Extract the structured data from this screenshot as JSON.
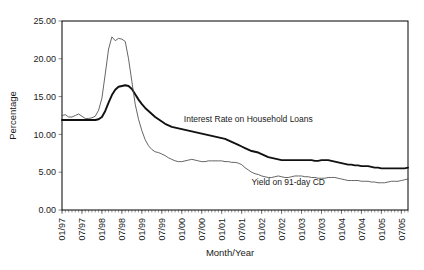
{
  "chart_data": {
    "type": "line",
    "title": "",
    "xlabel": "Month/Year",
    "ylabel": "Percentage",
    "ylim": [
      0,
      25
    ],
    "ytick_labels": [
      "0.00",
      "5.00",
      "10.00",
      "15.00",
      "20.00",
      "25.00"
    ],
    "ytick_values": [
      0,
      5,
      10,
      15,
      20,
      25
    ],
    "grid": false,
    "legend_position": "inline-annotation",
    "x_major_labels": [
      "01/97",
      "07/97",
      "01/98",
      "07/98",
      "01/99",
      "07/99",
      "01/00",
      "07/00",
      "01/01",
      "07/01",
      "01/02",
      "07/02",
      "01/03",
      "07/03",
      "01/04",
      "07/04",
      "01/05",
      "07/05"
    ],
    "x_major_indices": [
      0,
      6,
      12,
      18,
      24,
      30,
      36,
      42,
      48,
      54,
      60,
      66,
      72,
      78,
      84,
      90,
      96,
      102
    ],
    "x_count": 105,
    "series": [
      {
        "name": "Interest Rate on Household Loans",
        "style": "thick",
        "label_x_index": 56,
        "label_y_value": 11.6,
        "values": [
          11.9,
          11.9,
          11.9,
          11.9,
          11.9,
          11.9,
          11.9,
          11.9,
          11.9,
          11.9,
          11.9,
          12.0,
          12.3,
          13.1,
          14.2,
          15.2,
          15.9,
          16.3,
          16.4,
          16.5,
          16.4,
          16.0,
          15.3,
          14.6,
          14.0,
          13.5,
          13.1,
          12.7,
          12.3,
          12.0,
          11.7,
          11.4,
          11.2,
          11.0,
          10.9,
          10.8,
          10.7,
          10.6,
          10.5,
          10.4,
          10.3,
          10.2,
          10.1,
          10.0,
          9.9,
          9.8,
          9.7,
          9.6,
          9.5,
          9.4,
          9.2,
          9.0,
          8.8,
          8.6,
          8.4,
          8.2,
          8.0,
          7.8,
          7.7,
          7.6,
          7.4,
          7.2,
          7.0,
          6.9,
          6.8,
          6.7,
          6.6,
          6.6,
          6.6,
          6.6,
          6.6,
          6.6,
          6.6,
          6.6,
          6.6,
          6.6,
          6.5,
          6.5,
          6.6,
          6.6,
          6.6,
          6.5,
          6.4,
          6.3,
          6.2,
          6.1,
          6.0,
          6.0,
          5.9,
          5.9,
          5.8,
          5.8,
          5.8,
          5.7,
          5.6,
          5.6,
          5.5,
          5.5,
          5.5,
          5.5,
          5.5,
          5.5,
          5.5,
          5.5,
          5.6
        ]
      },
      {
        "name": "Yield on 91-day CD",
        "style": "thin",
        "label_x_index": 68,
        "label_y_value": 3.3,
        "values": [
          12.5,
          12.6,
          12.3,
          12.3,
          12.5,
          12.7,
          12.4,
          12.1,
          12.1,
          12.2,
          12.4,
          13.2,
          14.8,
          18.0,
          21.3,
          22.9,
          22.4,
          22.7,
          22.6,
          22.3,
          20.0,
          17.0,
          14.0,
          12.0,
          10.5,
          9.3,
          8.5,
          8.0,
          7.7,
          7.6,
          7.4,
          7.2,
          6.9,
          6.7,
          6.5,
          6.4,
          6.4,
          6.5,
          6.6,
          6.7,
          6.6,
          6.5,
          6.4,
          6.4,
          6.5,
          6.5,
          6.5,
          6.5,
          6.5,
          6.4,
          6.4,
          6.3,
          6.3,
          6.2,
          6.0,
          5.6,
          5.3,
          5.0,
          4.8,
          4.7,
          4.5,
          4.4,
          4.3,
          4.3,
          4.4,
          4.5,
          4.4,
          4.3,
          4.3,
          4.4,
          4.5,
          4.5,
          4.5,
          4.4,
          4.4,
          4.3,
          4.3,
          4.2,
          4.2,
          4.2,
          4.3,
          4.3,
          4.3,
          4.2,
          4.1,
          4.0,
          3.9,
          3.9,
          3.9,
          3.9,
          3.8,
          3.8,
          3.8,
          3.7,
          3.7,
          3.6,
          3.6,
          3.6,
          3.7,
          3.8,
          3.8,
          3.8,
          3.9,
          4.0,
          4.1
        ]
      }
    ]
  }
}
